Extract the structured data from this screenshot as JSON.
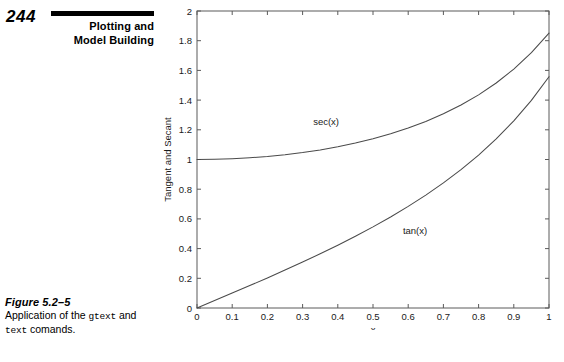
{
  "page": {
    "folio": "244",
    "running_head_line1": "Plotting and",
    "running_head_line2": "Model Building"
  },
  "caption": {
    "title": "Figure 5.2–5",
    "text_part1": "Application of the ",
    "code1": "gtext",
    "text_part2": " and ",
    "code2": "text",
    "text_part3": " comands."
  },
  "chart_data": {
    "type": "line",
    "title": "",
    "xlabel": "x",
    "ylabel": "Tangent and Secant",
    "xlim": [
      0,
      1
    ],
    "ylim": [
      0,
      2
    ],
    "grid": false,
    "legend": "none",
    "xticks": [
      "0",
      "0.1",
      "0.2",
      "0.3",
      "0.4",
      "0.5",
      "0.6",
      "0.7",
      "0.8",
      "0.9",
      "1"
    ],
    "xtick_values": [
      0,
      0.1,
      0.2,
      0.3,
      0.4,
      0.5,
      0.6,
      0.7,
      0.8,
      0.9,
      1
    ],
    "yticks": [
      "0",
      "0.2",
      "0.4",
      "0.6",
      "0.8",
      "1",
      "1.2",
      "1.4",
      "1.6",
      "1.8",
      "2"
    ],
    "ytick_values": [
      0,
      0.2,
      0.4,
      0.6,
      0.8,
      1,
      1.2,
      1.4,
      1.6,
      1.8,
      2
    ],
    "annotations": [
      {
        "text": "sec(x)",
        "x": 0.33,
        "y": 1.23
      },
      {
        "text": "tan(x)",
        "x": 0.585,
        "y": 0.495
      }
    ],
    "series": [
      {
        "name": "sec(x)",
        "x": [
          0,
          0.05,
          0.1,
          0.15,
          0.2,
          0.25,
          0.3,
          0.35,
          0.4,
          0.45,
          0.5,
          0.55,
          0.6,
          0.65,
          0.7,
          0.75,
          0.8,
          0.85,
          0.9,
          0.95,
          1
        ],
        "values": [
          1.0,
          1.00125,
          1.00502,
          1.01136,
          1.02034,
          1.03209,
          1.04675,
          1.06454,
          1.0857,
          1.11056,
          1.13949,
          1.17298,
          1.21163,
          1.25615,
          1.30747,
          1.36672,
          1.43534,
          1.51519,
          1.6087,
          1.71906,
          1.85082
        ]
      },
      {
        "name": "tan(x)",
        "x": [
          0,
          0.05,
          0.1,
          0.15,
          0.2,
          0.25,
          0.3,
          0.35,
          0.4,
          0.45,
          0.5,
          0.55,
          0.6,
          0.65,
          0.7,
          0.75,
          0.8,
          0.85,
          0.9,
          0.95,
          1
        ],
        "values": [
          0.0,
          0.05004,
          0.10033,
          0.15114,
          0.20271,
          0.25534,
          0.30934,
          0.36503,
          0.42279,
          0.48306,
          0.5463,
          0.61311,
          0.68414,
          0.7602,
          0.84229,
          0.9316,
          1.02964,
          1.13833,
          1.26016,
          1.39838,
          1.55741
        ]
      }
    ]
  }
}
